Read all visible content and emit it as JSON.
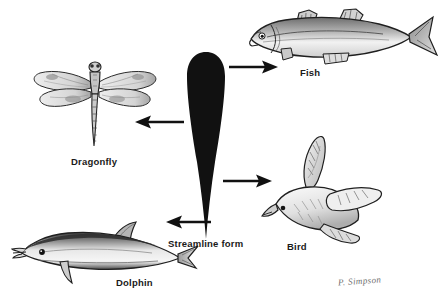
{
  "figure": {
    "background_color": "#ffffff",
    "ink_color": "#1a1a1a",
    "width": 441,
    "height": 304
  },
  "center": {
    "name": "streamline-form",
    "label": "Streamline form",
    "shape": "teardrop",
    "fill_color": "#111111"
  },
  "items": [
    {
      "id": "fish",
      "label": "Fish",
      "arrow_direction": "up-right",
      "arrow_label": "arrow-to-fish"
    },
    {
      "id": "dragonfly",
      "label": "Dragonfly",
      "arrow_direction": "left",
      "arrow_label": "arrow-to-dragonfly"
    },
    {
      "id": "bird",
      "label": "Bird",
      "arrow_direction": "down-right",
      "arrow_label": "arrow-to-bird"
    },
    {
      "id": "dolphin",
      "label": "Dolphin",
      "arrow_direction": "down-left",
      "arrow_label": "arrow-to-dolphin"
    }
  ],
  "credit": {
    "signature": "P. Simpson"
  }
}
